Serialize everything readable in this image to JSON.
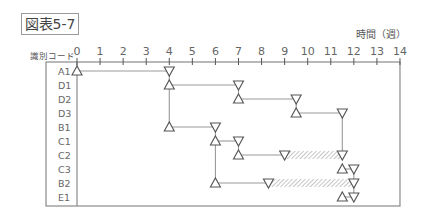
{
  "figure": {
    "title": "図表5-7",
    "x_axis_label": "時間（週）",
    "row_header": "識別コード"
  },
  "axis": {
    "ticks": [
      "0",
      "1",
      "2",
      "3",
      "4",
      "5",
      "6",
      "7",
      "8",
      "9",
      "10",
      "11",
      "12",
      "13",
      "14"
    ]
  },
  "rows": [
    {
      "code": "A1"
    },
    {
      "code": "D1"
    },
    {
      "code": "D2"
    },
    {
      "code": "D3"
    },
    {
      "code": "B1"
    },
    {
      "code": "C1"
    },
    {
      "code": "C2"
    },
    {
      "code": "C3"
    },
    {
      "code": "B2"
    },
    {
      "code": "E1"
    }
  ],
  "activities": [
    {
      "code": "A1",
      "start": 0,
      "end": 4,
      "float_end": null
    },
    {
      "code": "D1",
      "start": 4,
      "end": 7,
      "float_end": null
    },
    {
      "code": "D2",
      "start": 7,
      "end": 9.5,
      "float_end": null
    },
    {
      "code": "D3",
      "start": 9.5,
      "end": 11.5,
      "float_end": null
    },
    {
      "code": "B1",
      "start": 4,
      "end": 6,
      "float_end": null
    },
    {
      "code": "C1",
      "start": 6,
      "end": 7,
      "float_end": null
    },
    {
      "code": "C2",
      "start": 7,
      "end": 9,
      "float_end": 11.5
    },
    {
      "code": "C3",
      "start": 11.5,
      "end": 12,
      "float_end": null
    },
    {
      "code": "B2",
      "start": 6,
      "end": 8.3,
      "float_end": 12
    },
    {
      "code": "E1",
      "start": 11.5,
      "end": 12,
      "float_end": null
    }
  ],
  "colors": {
    "line": "#9a9a9a",
    "frame": "#8a8a8a",
    "marker": "#555555",
    "hatch": "#a0a0a0"
  }
}
